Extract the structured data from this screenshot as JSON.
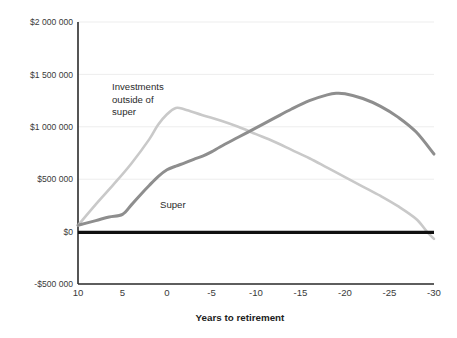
{
  "chart_data": {
    "type": "line",
    "title": "",
    "xlabel": "Years to retirement",
    "ylabel": "",
    "xlim": [
      10,
      -30
    ],
    "ylim": [
      -500000,
      2000000
    ],
    "x_ticks": [
      10,
      5,
      0,
      -5,
      -10,
      -15,
      -20,
      -25,
      -30
    ],
    "x_tick_labels": [
      "10",
      "5",
      "0",
      "-5",
      "-10",
      "-15",
      "-20",
      "-25",
      "-30"
    ],
    "y_ticks": [
      2000000,
      1500000,
      1000000,
      500000,
      0,
      -500000
    ],
    "y_tick_labels": [
      "$2 000 000",
      "$1 500 000",
      "$1 000 000",
      "$500 000",
      "$0",
      "-$500 000"
    ],
    "grid": true,
    "legend_position": "inline-annotations",
    "zero_line": {
      "value": 0,
      "color": "#111111",
      "width": 3.2
    },
    "series": [
      {
        "name": "Investments outside of super",
        "color": "#c9c9c9",
        "width": 2.6,
        "label_text": [
          "Investments",
          "outside of",
          "super"
        ],
        "x": [
          10,
          8,
          6,
          4,
          2,
          1,
          0,
          -1,
          -2,
          -4,
          -6,
          -8,
          -10,
          -12,
          -14,
          -16,
          -18,
          -20,
          -22,
          -24,
          -26,
          -28,
          -29.2,
          -30
        ],
        "y": [
          60000,
          260000,
          450000,
          650000,
          880000,
          1020000,
          1120000,
          1180000,
          1165000,
          1110000,
          1060000,
          1000000,
          930000,
          860000,
          780000,
          700000,
          610000,
          520000,
          430000,
          340000,
          240000,
          120000,
          0,
          -70000
        ]
      },
      {
        "name": "Super",
        "color": "#8e8e8e",
        "width": 3.0,
        "label_text": [
          "Super"
        ],
        "x": [
          10,
          8,
          6.5,
          5,
          4,
          3,
          2,
          1,
          0,
          -1,
          -2,
          -3,
          -4,
          -5,
          -6,
          -8,
          -10,
          -12,
          -14,
          -16,
          -18,
          -19,
          -20,
          -22,
          -24,
          -26,
          -28,
          -30
        ],
        "y": [
          60000,
          105000,
          140000,
          165000,
          255000,
          350000,
          440000,
          525000,
          590000,
          625000,
          655000,
          690000,
          720000,
          760000,
          810000,
          900000,
          990000,
          1080000,
          1170000,
          1250000,
          1305000,
          1320000,
          1315000,
          1270000,
          1195000,
          1090000,
          950000,
          740000
        ]
      }
    ],
    "annotations": [
      {
        "name": "investments-outside-of-super-label",
        "lines": [
          "Investments",
          "outside of",
          "super"
        ],
        "x_px": 112,
        "y_px": 90
      },
      {
        "name": "super-label",
        "lines": [
          "Super"
        ],
        "x_px": 160,
        "y_px": 208
      }
    ]
  }
}
